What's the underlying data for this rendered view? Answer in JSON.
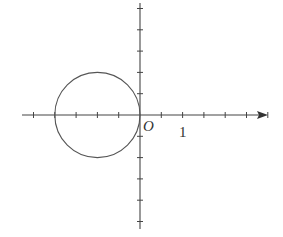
{
  "diagram": {
    "type": "coordinate-plane-with-circle",
    "colors": {
      "stroke": "#444444",
      "background": "#ffffff"
    },
    "origin_px": [
      140,
      115
    ],
    "tick_spacing_px": 21.3,
    "tick_unit": 0.5,
    "x_axis": {
      "from_px": 22,
      "to_px": 268,
      "arrow": "right",
      "ticks_left": 5,
      "ticks_right": 6
    },
    "y_axis": {
      "from_px": 3,
      "to_px": 229,
      "arrow": "none",
      "ticks_up": 5,
      "ticks_down": 5
    },
    "labels": {
      "origin": "O",
      "unit": "1"
    },
    "circle": {
      "center": [
        -1,
        0
      ],
      "radius": 1,
      "description": "Circle centered at (-1, 0) with radius 1, tangent to the y-axis at O"
    }
  }
}
